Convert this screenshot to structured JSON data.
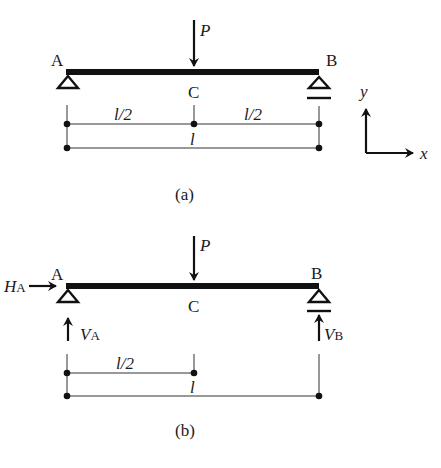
{
  "colors": {
    "ink": "#111111",
    "thin": "#333333",
    "background": "#ffffff"
  },
  "part_a": {
    "caption": "(a)",
    "load_label": "P",
    "left_support_label": "A",
    "right_support_label": "B",
    "mid_label": "C",
    "dim_half_left": "l/2",
    "dim_half_right": "l/2",
    "dim_total": "l",
    "axes": {
      "x_label": "x",
      "y_label": "y"
    },
    "left_support_type": "pin-icon",
    "right_support_type": "roller-icon"
  },
  "part_b": {
    "caption": "(b)",
    "load_label": "P",
    "left_support_label": "A",
    "right_support_label": "B",
    "mid_label": "C",
    "horizontal_reaction": {
      "main": "H",
      "sub": "A"
    },
    "vertical_reaction_a": {
      "main": "V",
      "sub": "A"
    },
    "vertical_reaction_b": {
      "main": "V",
      "sub": "B"
    },
    "dim_half": "l/2",
    "dim_total": "l"
  }
}
